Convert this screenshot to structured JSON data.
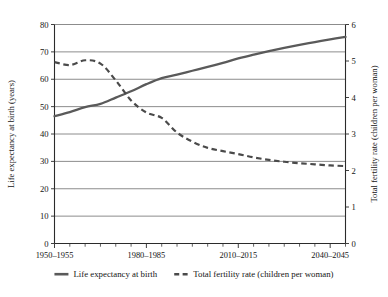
{
  "chart_data": {
    "type": "line",
    "title": "",
    "xlabel": "",
    "grid": "horizontal",
    "legend_position": "bottom",
    "x_tick_labels": [
      "1950–1955",
      "1980–1985",
      "2010–2015",
      "2040–2045"
    ],
    "x_tick_label_periods": [
      0,
      6,
      12,
      18
    ],
    "periods": [
      "1950–1955",
      "1955–1960",
      "1960–1965",
      "1965–1970",
      "1970–1975",
      "1975–1980",
      "1980–1985",
      "1985–1990",
      "1990–1995",
      "1995–2000",
      "2000–2005",
      "2005–2010",
      "2010–2015",
      "2015–2020",
      "2020–2025",
      "2025–2030",
      "2030–2035",
      "2035–2040",
      "2040–2045",
      "2045–2050"
    ],
    "left_axis": {
      "label": "Life expectancy at birth (years)",
      "ylim": [
        0,
        80
      ],
      "ticks": [
        0,
        10,
        20,
        30,
        40,
        50,
        60,
        70,
        80
      ],
      "unit": "years"
    },
    "right_axis": {
      "label": "Total fertility rate (children per woman)",
      "ylim": [
        0,
        6
      ],
      "ticks": [
        0,
        1,
        2,
        3,
        4,
        5,
        6
      ],
      "unit": "children per woman"
    },
    "series": [
      {
        "name": "Life expectancy at birth",
        "axis": "left",
        "style": "solid",
        "color": "#5a5a5a",
        "values": [
          46.5,
          48.0,
          49.8,
          51.0,
          53.3,
          55.6,
          58.2,
          60.4,
          61.7,
          63.1,
          64.5,
          66.0,
          67.6,
          69.0,
          70.3,
          71.5,
          72.6,
          73.6,
          74.6,
          75.5
        ]
      },
      {
        "name": "Total fertility rate (children per woman)",
        "axis": "right",
        "style": "dashed",
        "color": "#4a4a4a",
        "values": [
          4.97,
          4.89,
          5.02,
          4.93,
          4.47,
          3.92,
          3.59,
          3.44,
          3.04,
          2.79,
          2.62,
          2.53,
          2.45,
          2.36,
          2.29,
          2.24,
          2.2,
          2.17,
          2.14,
          2.12
        ]
      }
    ],
    "legend": [
      {
        "label": "Life expectancy at birth",
        "style": "solid"
      },
      {
        "label": "Total fertility rate (children per woman)",
        "style": "dashed"
      }
    ]
  }
}
